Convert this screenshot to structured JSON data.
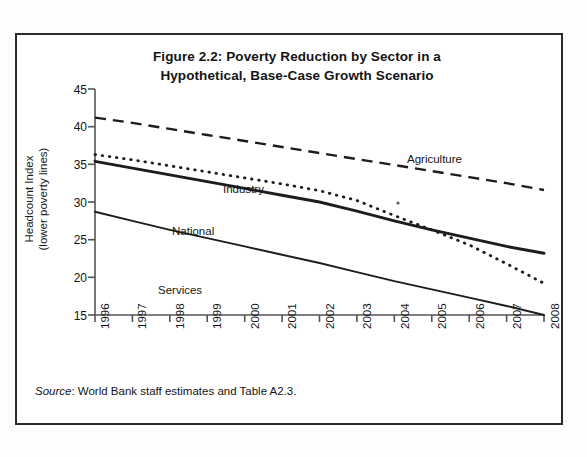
{
  "figure": {
    "title_line1": "Figure 2.2: Poverty Reduction by Sector in a",
    "title_line2": "Hypothetical, Base-Case Growth Scenario",
    "source_word": "Source",
    "source_text": ": World Bank staff estimates and Table A2.3."
  },
  "axes": {
    "y_title_line1": "Headcount Index",
    "y_title_line2": "(lower poverty lines)",
    "y_ticks": [
      "45",
      "40",
      "35",
      "30",
      "25",
      "20",
      "15"
    ],
    "x_ticks": [
      "1996",
      "1997",
      "1998",
      "1999",
      "2000",
      "2001",
      "2002",
      "2003",
      "2004",
      "2005",
      "2006",
      "2007",
      "2008"
    ]
  },
  "series_labels": {
    "agriculture": "Agriculture",
    "industry": "Industry",
    "national": "National",
    "services": "Services"
  },
  "chart_data": {
    "type": "line",
    "title": "Figure 2.2: Poverty Reduction by Sector in a Hypothetical, Base-Case Growth Scenario",
    "xlabel": "",
    "ylabel": "Headcount Index (lower poverty lines)",
    "ylim": [
      15,
      45
    ],
    "yticks": [
      15,
      20,
      25,
      30,
      35,
      40,
      45
    ],
    "grid": false,
    "legend": "inline-labels",
    "x": [
      1996,
      1997,
      1998,
      1999,
      2000,
      2001,
      2002,
      2003,
      2004,
      2005,
      2006,
      2007,
      2008
    ],
    "series": [
      {
        "name": "Agriculture",
        "style": "dashed",
        "values": [
          41.2,
          40.5,
          39.7,
          38.9,
          38.1,
          37.3,
          36.5,
          35.7,
          34.9,
          34.1,
          33.3,
          32.5,
          31.6
        ]
      },
      {
        "name": "Industry",
        "style": "dotted",
        "values": [
          36.3,
          35.6,
          34.8,
          34.0,
          33.2,
          32.4,
          31.5,
          30.2,
          28.2,
          26.3,
          24.3,
          21.8,
          19.2
        ]
      },
      {
        "name": "National",
        "style": "solid-thick",
        "values": [
          35.4,
          34.5,
          33.6,
          32.7,
          31.8,
          30.9,
          30.0,
          28.8,
          27.5,
          26.3,
          25.2,
          24.1,
          23.2
        ]
      },
      {
        "name": "Services",
        "style": "solid-thin",
        "values": [
          28.7,
          27.5,
          26.3,
          25.2,
          24.1,
          23.0,
          21.9,
          20.7,
          19.5,
          18.4,
          17.3,
          16.2,
          15.0
        ]
      }
    ]
  },
  "colors": {
    "ink": "#1a1a1a",
    "frame": "#2b2b2b",
    "axis": "#555555",
    "page": "#fdfdfc"
  }
}
